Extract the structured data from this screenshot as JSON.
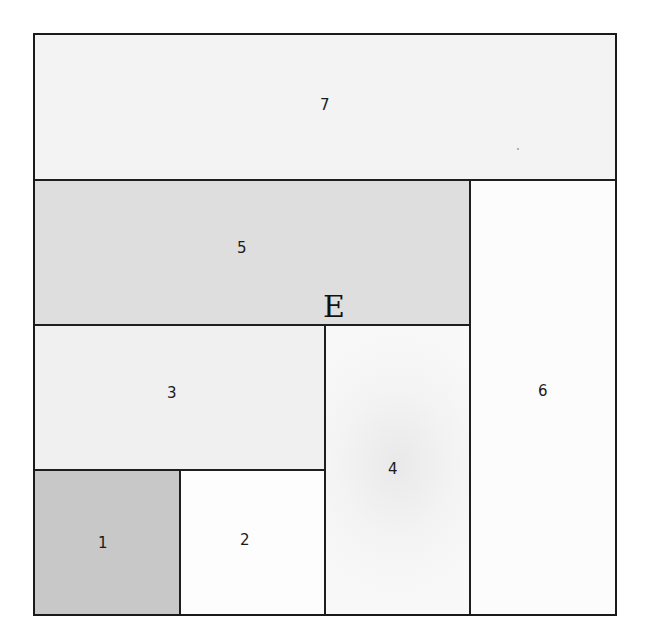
{
  "diagram": {
    "type": "rectangle-partition",
    "grid_units": 4,
    "regions": [
      {
        "id": "1",
        "label": "1",
        "col": 0,
        "row": 3,
        "cols": 1,
        "rows": 1,
        "fill": "#c8c8c8"
      },
      {
        "id": "2",
        "label": "2",
        "col": 1,
        "row": 3,
        "cols": 1,
        "rows": 1,
        "fill": "#fdfdfd"
      },
      {
        "id": "3",
        "label": "3",
        "col": 0,
        "row": 2,
        "cols": 2,
        "rows": 1,
        "fill": "#f0f0f0"
      },
      {
        "id": "4",
        "label": "4",
        "col": 2,
        "row": 2,
        "cols": 1,
        "rows": 2,
        "fill": "#f4f4f4"
      },
      {
        "id": "5",
        "label": "5",
        "col": 0,
        "row": 1,
        "cols": 3,
        "rows": 1,
        "fill": "#dedede"
      },
      {
        "id": "6",
        "label": "6",
        "col": 3,
        "row": 1,
        "cols": 1,
        "rows": 3,
        "fill": "#fcfcfc"
      },
      {
        "id": "7",
        "label": "7",
        "col": 0,
        "row": 0,
        "cols": 4,
        "rows": 1,
        "fill": "#f3f3f3"
      }
    ],
    "point_label": "E",
    "colors": {
      "border": "#1a1a1a",
      "text": "#1a1a1a"
    }
  }
}
